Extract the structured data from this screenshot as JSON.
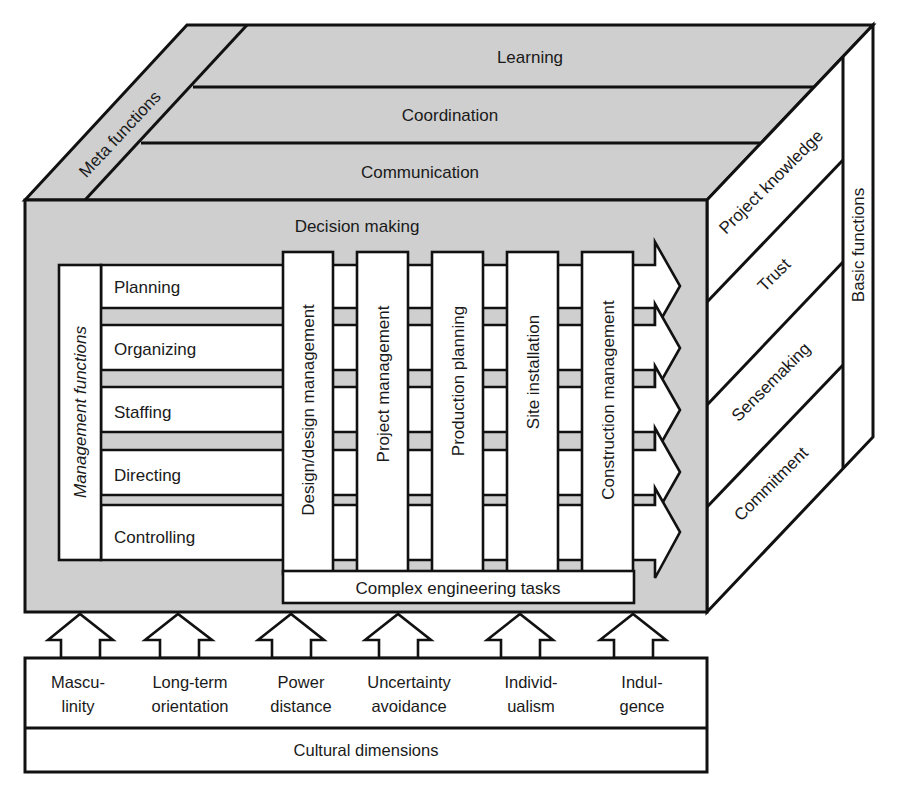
{
  "diagram": {
    "top_face": {
      "meta_label": "Meta functions",
      "layers": [
        "Learning",
        "Coordination",
        "Communication"
      ]
    },
    "front_face": {
      "title": "Decision making",
      "management": {
        "label": "Management functions",
        "rows": [
          "Planning",
          "Organizing",
          "Staffing",
          "Directing",
          "Controlling"
        ]
      },
      "columns": [
        "Design/design management",
        "Project management",
        "Production planning",
        "Site installation",
        "Construction management"
      ],
      "base_bar": "Complex engineering tasks"
    },
    "side_face": {
      "label": "Basic functions",
      "items": [
        "Project knowledge",
        "Trust",
        "Sensemaking",
        "Commitment"
      ]
    },
    "cultural": {
      "label": "Cultural dimensions",
      "dimensions": [
        {
          "line1": "Mascu-",
          "line2": "linity"
        },
        {
          "line1": "Long-term",
          "line2": "orientation"
        },
        {
          "line1": "Power",
          "line2": "distance"
        },
        {
          "line1": "Uncertainty",
          "line2": "avoidance"
        },
        {
          "line1": "Individ-",
          "line2": "ualism"
        },
        {
          "line1": "Indul-",
          "line2": "gence"
        }
      ]
    },
    "colors": {
      "face_gray": "#cfcfcf",
      "box_white": "#ffffff",
      "line": "#111111"
    }
  }
}
